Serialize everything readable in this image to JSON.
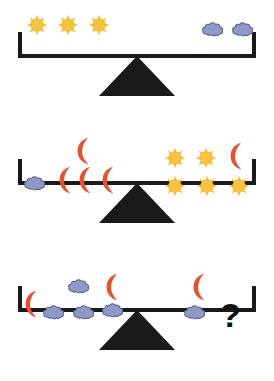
{
  "colors": {
    "sun": "#F5C33C",
    "sun_edge": "#EDA81F",
    "cloud": "#8E99C6",
    "cloud_outline": "#5A6392",
    "moon": "#EB4F2B",
    "beam": "#1A1A1A",
    "fulcrum": "#1A1A1A",
    "background": "#FFFFFF",
    "question": "#111111"
  },
  "icon_names": {
    "sun": "sun-icon",
    "cloud": "cloud-icon",
    "moon": "crescent-moon-icon",
    "question": "question-mark"
  },
  "scales": [
    {
      "id": "scale-1",
      "tilt": "level",
      "left": {
        "label": "left-pan",
        "counts": {
          "sun": 3,
          "cloud": 0,
          "moon": 0
        },
        "items": [
          {
            "icon": "sun",
            "x": 26,
            "y": 14
          },
          {
            "icon": "sun",
            "x": 57,
            "y": 14
          },
          {
            "icon": "sun",
            "x": 88,
            "y": 14
          }
        ]
      },
      "right": {
        "label": "right-pan",
        "counts": {
          "sun": 0,
          "cloud": 2,
          "moon": 0
        },
        "items": [
          {
            "icon": "cloud",
            "x": 201,
            "y": 19
          },
          {
            "icon": "cloud",
            "x": 231,
            "y": 19
          }
        ]
      },
      "question": null
    },
    {
      "id": "scale-2",
      "tilt": "level",
      "left": {
        "label": "left-pan",
        "counts": {
          "sun": 0,
          "cloud": 1,
          "moon": 4
        },
        "items": [
          {
            "icon": "moon",
            "x": 74,
            "y": 9
          },
          {
            "icon": "cloud",
            "x": 23,
            "y": 46
          },
          {
            "icon": "moon",
            "x": 56,
            "y": 38
          },
          {
            "icon": "moon",
            "x": 76,
            "y": 38
          },
          {
            "icon": "moon",
            "x": 99,
            "y": 38
          }
        ]
      },
      "right": {
        "label": "right-pan",
        "counts": {
          "sun": 5,
          "cloud": 0,
          "moon": 1
        },
        "items": [
          {
            "icon": "sun",
            "x": 164,
            "y": 20
          },
          {
            "icon": "sun",
            "x": 195,
            "y": 20
          },
          {
            "icon": "moon",
            "x": 227,
            "y": 14
          },
          {
            "icon": "sun",
            "x": 164,
            "y": 48
          },
          {
            "icon": "sun",
            "x": 196,
            "y": 48
          },
          {
            "icon": "sun",
            "x": 228,
            "y": 48
          }
        ]
      },
      "question": null
    },
    {
      "id": "scale-3",
      "tilt": "level",
      "left": {
        "label": "left-pan",
        "counts": {
          "sun": 0,
          "cloud": 4,
          "moon": 2
        },
        "items": [
          {
            "icon": "cloud",
            "x": 67,
            "y": 22
          },
          {
            "icon": "moon",
            "x": 103,
            "y": 18
          },
          {
            "icon": "moon",
            "x": 22,
            "y": 35
          },
          {
            "icon": "cloud",
            "x": 42,
            "y": 48
          },
          {
            "icon": "cloud",
            "x": 72,
            "y": 48
          },
          {
            "icon": "cloud",
            "x": 101,
            "y": 46
          }
        ]
      },
      "right": {
        "label": "right-pan",
        "counts": {
          "sun": 0,
          "cloud": 1,
          "moon": 1
        },
        "items": [
          {
            "icon": "moon",
            "x": 190,
            "y": 18
          },
          {
            "icon": "cloud",
            "x": 183,
            "y": 48
          }
        ]
      },
      "question": {
        "text": "?",
        "x": 220,
        "y": 44
      }
    }
  ]
}
